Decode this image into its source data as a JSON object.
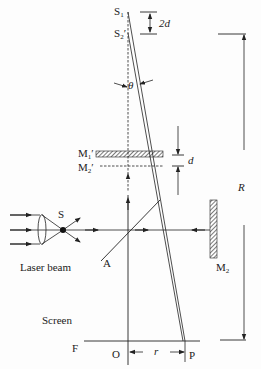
{
  "diagram": {
    "labels": {
      "s1": {
        "main": "S",
        "sub": "1",
        "prime": ""
      },
      "s2p": {
        "main": "S",
        "sub": "2",
        "prime": "′"
      },
      "two_d": "2d",
      "theta": "θ",
      "m1p": {
        "main": "M",
        "sub": "1",
        "prime": "′"
      },
      "m2p": {
        "main": "M",
        "sub": "2",
        "prime": "′"
      },
      "d": "d",
      "R": "R",
      "source": "S",
      "laser": "Laser beam",
      "splitter": "A",
      "m2": {
        "main": "M",
        "sub": "2"
      },
      "screen": "Screen",
      "F": "F",
      "O": "O",
      "r": "r",
      "P": "P"
    },
    "colors": {
      "ink": "#222222",
      "background": "#fdfdfd"
    }
  }
}
